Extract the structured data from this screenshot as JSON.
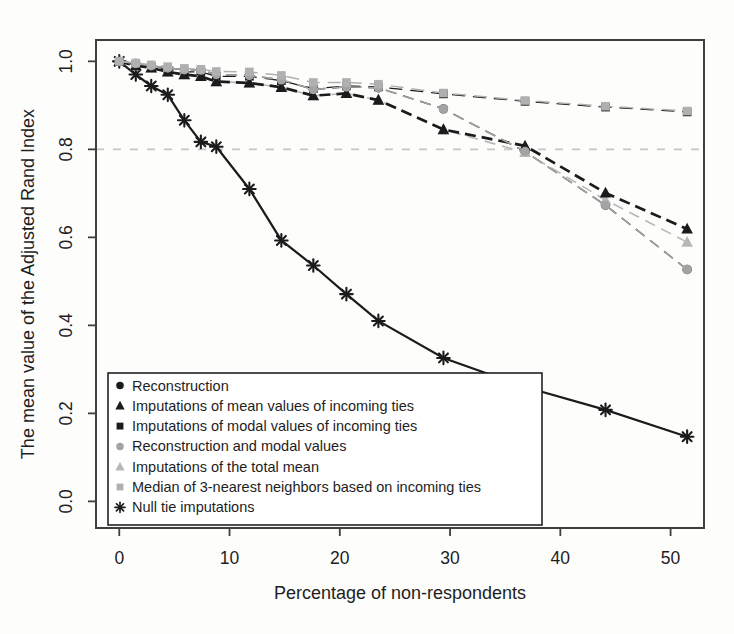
{
  "chart_data": {
    "type": "line",
    "title": "",
    "xlabel": "Percentage of non-respondents",
    "ylabel": "The mean value of the Adjusted Rand Index",
    "xlim": [
      -2.11,
      53.03
    ],
    "ylim": [
      -0.0605,
      1.0485
    ],
    "x_ticks": [
      0,
      10,
      20,
      30,
      40,
      50
    ],
    "x_tick_labels": [
      "0",
      "10",
      "20",
      "30",
      "40",
      "50"
    ],
    "y_ticks": [
      0.0,
      0.2,
      0.4,
      0.6,
      0.8,
      1.0
    ],
    "y_tick_labels": [
      "0.0",
      "0.2",
      "0.4",
      "0.6",
      "0.8",
      "1.0"
    ],
    "grid": false,
    "reference_line_y": 0.8,
    "legend_position": "bottom-left-inside",
    "x": [
      0,
      1.5,
      2.9,
      4.4,
      5.9,
      7.4,
      8.8,
      11.8,
      14.7,
      17.6,
      20.6,
      23.5,
      29.4,
      36.8,
      44.1,
      51.5
    ],
    "series": [
      {
        "name": "Reconstruction",
        "marker": "circle",
        "color": "#1b1b1b",
        "dash": "11,7",
        "width": 1.4,
        "values": [
          1.0,
          0.995,
          0.99,
          0.985,
          0.981,
          0.98,
          0.97,
          0.968,
          0.958,
          0.936,
          0.942,
          0.94,
          0.892,
          0.795,
          0.673,
          0.527
        ]
      },
      {
        "name": "Imputations of mean values of incoming ties",
        "marker": "triangle",
        "color": "#1b1b1b",
        "dash": "11,6",
        "width": 2.7,
        "values": [
          1.0,
          0.99,
          0.985,
          0.976,
          0.97,
          0.966,
          0.954,
          0.951,
          0.941,
          0.922,
          0.927,
          0.912,
          0.845,
          0.808,
          0.701,
          0.619
        ]
      },
      {
        "name": "Imputations of modal values of incoming ties",
        "marker": "square",
        "color": "#1b1b1b",
        "dash": "13,8",
        "width": 1.3,
        "values": [
          1.0,
          0.992,
          0.987,
          0.981,
          0.976,
          0.976,
          0.966,
          0.966,
          0.956,
          0.938,
          0.944,
          0.942,
          0.926,
          0.909,
          0.896,
          0.885
        ]
      },
      {
        "name": "Reconstruction and modal values",
        "marker": "circle",
        "color": "#a3a3a3",
        "dash": "11,7",
        "width": 1.6,
        "values": [
          1.0,
          0.995,
          0.99,
          0.985,
          0.981,
          0.98,
          0.97,
          0.968,
          0.958,
          0.936,
          0.942,
          0.94,
          0.892,
          0.795,
          0.673,
          0.527
        ]
      },
      {
        "name": "Imputations of the total mean",
        "marker": "triangle",
        "color": "#b8b8b8",
        "dash": "11,7",
        "width": 1.6,
        "values": [
          1.0,
          0.99,
          0.985,
          0.976,
          0.97,
          0.966,
          0.954,
          0.951,
          0.941,
          0.922,
          0.927,
          0.912,
          0.845,
          0.793,
          0.685,
          0.589
        ]
      },
      {
        "name": "Median of 3-nearest neighbors based on incoming ties",
        "marker": "square",
        "color": "#b0b0b0",
        "dash": "13,8",
        "width": 1.5,
        "values": [
          1.0,
          0.996,
          0.992,
          0.988,
          0.984,
          0.982,
          0.977,
          0.976,
          0.968,
          0.952,
          0.952,
          0.948,
          0.928,
          0.911,
          0.898,
          0.887
        ]
      },
      {
        "name": "Null tie imputations",
        "marker": "asterisk",
        "color": "#1b1b1b",
        "dash": "",
        "width": 2.2,
        "values": [
          1.0,
          0.97,
          0.944,
          0.924,
          0.866,
          0.817,
          0.806,
          0.71,
          0.593,
          0.536,
          0.471,
          0.41,
          0.326,
          0.26,
          0.208,
          0.147
        ]
      }
    ],
    "draw_order": [
      6,
      0,
      2,
      4,
      1,
      3,
      5
    ],
    "colors": {
      "axis": "#3f3f3f",
      "text": "#1e1e1e",
      "reference_line": "#c6c6c6",
      "legend_border": "#222222",
      "legend_background": "#ffffff"
    }
  }
}
